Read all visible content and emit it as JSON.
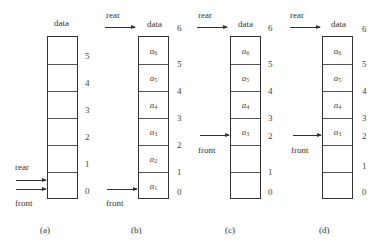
{
  "figure": {
    "type": "sequential-queue-states",
    "column_header": "data",
    "pointer_labels": {
      "rear": "rear",
      "front": "front"
    },
    "panels": [
      {
        "caption": "(a)",
        "indices": [
          "5",
          "4",
          "3",
          "2",
          "1",
          "0"
        ],
        "cells": [
          "",
          "",
          "",
          "",
          "",
          ""
        ],
        "rear_at": "0",
        "front_at": "0"
      },
      {
        "caption": "(b)",
        "indices": [
          "6",
          "5",
          "4",
          "3",
          "2",
          "1",
          "0"
        ],
        "cells": [
          "a6",
          "a5",
          "a4",
          "a3",
          "a2",
          "a1"
        ],
        "cell_labels": [
          {
            "base": "a",
            "sub": "6"
          },
          {
            "base": "a",
            "sub": "5"
          },
          {
            "base": "a",
            "sub": "4"
          },
          {
            "base": "a",
            "sub": "3"
          },
          {
            "base": "a",
            "sub": "2"
          },
          {
            "base": "a",
            "sub": "1"
          }
        ],
        "rear_at": "6",
        "front_at": "0"
      },
      {
        "caption": "(c)",
        "indices": [
          "6",
          "5",
          "4",
          "3",
          "2",
          "1",
          "0"
        ],
        "cells": [
          "a6",
          "a5",
          "a4",
          "a3",
          "",
          ""
        ],
        "cell_labels": [
          {
            "base": "a",
            "sub": "6"
          },
          {
            "base": "a",
            "sub": "5"
          },
          {
            "base": "a",
            "sub": "4"
          },
          {
            "base": "a",
            "sub": "3"
          },
          {
            "base": "",
            "sub": ""
          },
          {
            "base": "",
            "sub": ""
          }
        ],
        "rear_at": "6",
        "front_at": "2"
      },
      {
        "caption": "(d)",
        "indices": [
          "6",
          "5",
          "4",
          "3",
          "2",
          "1",
          "0"
        ],
        "cells": [
          "a6",
          "a5",
          "a4",
          "a3",
          "",
          ""
        ],
        "cell_labels": [
          {
            "base": "a",
            "sub": "6"
          },
          {
            "base": "a",
            "sub": "5"
          },
          {
            "base": "a",
            "sub": "4"
          },
          {
            "base": "a",
            "sub": "3"
          },
          {
            "base": "",
            "sub": ""
          },
          {
            "base": "",
            "sub": ""
          }
        ],
        "rear_at": "6",
        "front_at": "2"
      }
    ]
  }
}
